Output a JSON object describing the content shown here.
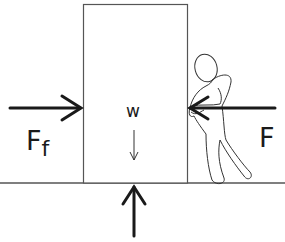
{
  "diagram": {
    "type": "free-body-diagram",
    "labels": {
      "friction_main": "F",
      "friction_sub": "f",
      "applied_force": "F",
      "weight": "w"
    },
    "forces": [
      {
        "name": "friction",
        "label": "Ff",
        "direction": "right",
        "target": "left side of box"
      },
      {
        "name": "applied",
        "label": "F",
        "direction": "left",
        "target": "right side of box",
        "source": "person pushing"
      },
      {
        "name": "weight",
        "label": "w",
        "direction": "down",
        "target": "center of box"
      },
      {
        "name": "normal",
        "label": "",
        "direction": "up",
        "target": "bottom of box"
      }
    ],
    "colors": {
      "stroke": "#1a1a1a",
      "box_stroke": "#555555",
      "background": "#ffffff"
    }
  }
}
